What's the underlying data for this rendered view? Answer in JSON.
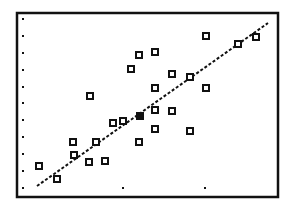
{
  "chart_data": {
    "type": "scatter",
    "title": "",
    "xlabel": "",
    "ylabel": "",
    "grid": false,
    "legend": null,
    "units_note": "Values expressed in axis tick units (x: Xscl ticks from first x-tick, y: Yscl ticks above bottom tick row)",
    "xlim": [
      -0.29,
      2.89
    ],
    "ylim": [
      -0.59,
      10.3
    ],
    "x_ticks": [
      0,
      1,
      2
    ],
    "y_ticks": [
      0,
      1,
      2,
      3,
      4,
      5,
      6,
      7,
      8,
      9,
      10
    ],
    "series": [
      {
        "name": "data",
        "marker": "hollow-square",
        "points": [
          {
            "x": -0.02,
            "y": 1.29
          },
          {
            "x": 0.2,
            "y": 0.53
          },
          {
            "x": 0.39,
            "y": 2.71
          },
          {
            "x": 0.4,
            "y": 1.94
          },
          {
            "x": 0.59,
            "y": 1.53
          },
          {
            "x": 0.6,
            "y": 5.41
          },
          {
            "x": 0.67,
            "y": 2.71
          },
          {
            "x": 0.78,
            "y": 1.59
          },
          {
            "x": 0.88,
            "y": 3.82
          },
          {
            "x": 1.0,
            "y": 3.94
          },
          {
            "x": 1.1,
            "y": 7.0
          },
          {
            "x": 1.2,
            "y": 7.82
          },
          {
            "x": 1.2,
            "y": 2.71
          },
          {
            "x": 1.21,
            "y": 4.24
          },
          {
            "x": 1.39,
            "y": 8.0
          },
          {
            "x": 1.39,
            "y": 5.88
          },
          {
            "x": 1.39,
            "y": 4.59
          },
          {
            "x": 1.39,
            "y": 3.47
          },
          {
            "x": 1.6,
            "y": 6.71
          },
          {
            "x": 1.6,
            "y": 4.53
          },
          {
            "x": 1.82,
            "y": 6.53
          },
          {
            "x": 1.82,
            "y": 3.35
          },
          {
            "x": 2.01,
            "y": 8.94
          },
          {
            "x": 2.01,
            "y": 5.88
          },
          {
            "x": 2.4,
            "y": 8.47
          },
          {
            "x": 2.62,
            "y": 8.88
          }
        ]
      },
      {
        "name": "regression-line",
        "type": "line",
        "style": "dotted",
        "points": [
          {
            "x": -0.05,
            "y": 0.12
          },
          {
            "x": 2.77,
            "y": 9.71
          }
        ]
      }
    ]
  },
  "render": {
    "frame": {
      "x": 17,
      "y": 13,
      "w": 261,
      "h": 184
    },
    "y_tick_px": {
      "x": 23,
      "ys": [
        19,
        36,
        53,
        70,
        87,
        103,
        120,
        137,
        154,
        171,
        188
      ]
    },
    "x_tick_px": {
      "y": 188,
      "xs": [
        123,
        205
      ]
    },
    "points_px": [
      [
        39,
        166
      ],
      [
        57,
        179
      ],
      [
        73,
        142
      ],
      [
        74,
        155
      ],
      [
        89,
        162
      ],
      [
        90,
        96
      ],
      [
        96,
        142
      ],
      [
        105,
        161
      ],
      [
        113,
        123
      ],
      [
        123,
        121
      ],
      [
        131,
        69
      ],
      [
        139,
        55
      ],
      [
        139,
        142
      ],
      [
        140,
        116
      ],
      [
        155,
        52
      ],
      [
        155,
        88
      ],
      [
        155,
        110
      ],
      [
        155,
        129
      ],
      [
        172,
        74
      ],
      [
        172,
        111
      ],
      [
        190,
        77
      ],
      [
        190,
        131
      ],
      [
        206,
        36
      ],
      [
        206,
        88
      ],
      [
        238,
        44
      ],
      [
        256,
        37
      ]
    ],
    "filled_point_index": 13,
    "line_px": [
      37,
      186,
      268,
      23
    ],
    "colors": {
      "ink": "#111111",
      "paper": "#ffffff"
    }
  }
}
